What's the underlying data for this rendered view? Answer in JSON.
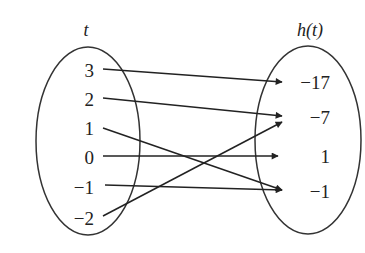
{
  "diagram": {
    "type": "mapping-diagram",
    "domain_label": "t",
    "range_label": "h(t)",
    "domain": [
      "3",
      "2",
      "1",
      "0",
      "−1",
      "−2"
    ],
    "range": [
      "−17",
      "−7",
      "1",
      "−1"
    ],
    "mappings": [
      {
        "from": "3",
        "to": "−17"
      },
      {
        "from": "2",
        "to": "−7"
      },
      {
        "from": "1",
        "to": "−1"
      },
      {
        "from": "0",
        "to": "1"
      },
      {
        "from": "−1",
        "to": "−1"
      },
      {
        "from": "−2",
        "to": "−7"
      }
    ],
    "colors": {
      "stroke": "#222222",
      "background": "#ffffff"
    }
  }
}
